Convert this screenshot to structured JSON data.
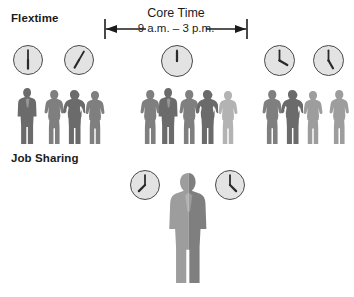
{
  "figure": {
    "width": 354,
    "height": 297,
    "background": "#ffffff"
  },
  "sections": {
    "flextime": {
      "title": "Flextime"
    },
    "job_sharing": {
      "title": "Job Sharing"
    }
  },
  "core_time": {
    "label": "Core Time",
    "hours": "9 a.m. – 3 p.m.",
    "hours_value": "9 a.m. – 3 p.m.",
    "start": "9 a.m.",
    "end": "3 p.m.",
    "arrow": "double-headed-arrow"
  },
  "colors": {
    "ink": "#1b1b1b",
    "clock_face": "#e3e3e3",
    "clock_outline": "#4a4a4a",
    "person_dark": "#6b6b6b",
    "person_mid": "#7f7f7f",
    "person_light": "#9d9d9d",
    "person_pale": "#b3b3b3"
  },
  "flextime_clocks": [
    {
      "name": "clock-early-1",
      "time": "6:30",
      "hour_angle": 180,
      "minute_angle": 0,
      "x": 13,
      "y": 45,
      "size": 30
    },
    {
      "name": "clock-early-2",
      "time": "7:05",
      "hour_angle": 210,
      "minute_angle": 30,
      "x": 64,
      "y": 45,
      "size": 30
    },
    {
      "name": "clock-core",
      "time": "12:00",
      "hour_angle": 0,
      "minute_angle": 0,
      "x": 161,
      "y": 45,
      "size": 32
    },
    {
      "name": "clock-late-1",
      "time": "4:00",
      "hour_angle": 120,
      "minute_angle": 0,
      "x": 264,
      "y": 45,
      "size": 31
    },
    {
      "name": "clock-late-2",
      "time": "5:00",
      "hour_angle": 150,
      "minute_angle": 0,
      "x": 313,
      "y": 45,
      "size": 31
    }
  ],
  "job_sharing_clocks": [
    {
      "name": "clock-jobshare-left",
      "time": "7:30",
      "hour_angle": 225,
      "minute_angle": 0,
      "x": 130,
      "y": 170,
      "size": 30
    },
    {
      "name": "clock-jobshare-right",
      "time": "4:30",
      "hour_angle": 135,
      "minute_angle": 0,
      "x": 215,
      "y": 170,
      "size": 30
    }
  ],
  "flextime_groups": [
    {
      "name": "people-group-early",
      "people": [
        {
          "type": "man-suit",
          "shade": "person_dark",
          "x": 16,
          "scale": 1.0
        },
        {
          "type": "woman",
          "shade": "person_mid",
          "x": 43,
          "scale": 0.97
        },
        {
          "type": "man-hands-on-hips",
          "shade": "person_dark",
          "x": 63,
          "scale": 0.97
        },
        {
          "type": "woman",
          "shade": "person_mid",
          "x": 84,
          "scale": 0.95
        }
      ]
    },
    {
      "name": "people-group-core",
      "people": [
        {
          "type": "woman",
          "shade": "person_mid",
          "x": 139,
          "scale": 0.97
        },
        {
          "type": "man-suit",
          "shade": "person_dark",
          "x": 157,
          "scale": 1.0
        },
        {
          "type": "woman",
          "shade": "person_mid",
          "x": 178,
          "scale": 0.97
        },
        {
          "type": "man-hands-on-hips",
          "shade": "person_dark",
          "x": 196,
          "scale": 0.97
        },
        {
          "type": "woman",
          "shade": "person_pale",
          "x": 217,
          "scale": 0.95
        }
      ]
    },
    {
      "name": "people-group-late",
      "people": [
        {
          "type": "woman",
          "shade": "person_mid",
          "x": 261,
          "scale": 0.97
        },
        {
          "type": "man-hands-on-hips",
          "shade": "person_dark",
          "x": 281,
          "scale": 0.97
        },
        {
          "type": "woman",
          "shade": "person_light",
          "x": 302,
          "scale": 0.95
        }
      ]
    },
    {
      "name": "people-group-latest",
      "people": [
        {
          "type": "woman",
          "shade": "person_light",
          "x": 328,
          "scale": 0.97
        }
      ]
    }
  ],
  "job_sharing_figure": {
    "name": "shared-job-person",
    "description": "single person silhouette split into two shades",
    "left_shade": "person_light",
    "right_shade": "person_mid",
    "x": 166,
    "y": 173
  }
}
